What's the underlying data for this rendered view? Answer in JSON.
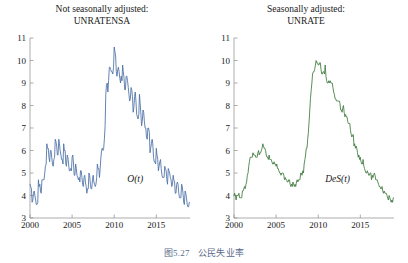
{
  "caption": {
    "number": "图5.27",
    "text": "公民失业率"
  },
  "panels": [
    {
      "title_line1": "Not seasonally adjusted:",
      "title_line2": "UNRATENSA",
      "curve_label": "O(t)",
      "color": "#4a6fa5"
    },
    {
      "title_line1": "Seasonally adjusted:",
      "title_line2": "UNRATE",
      "curve_label": "DeS(t)",
      "color": "#3e7a3e"
    }
  ],
  "chart_data": [
    {
      "type": "line",
      "title": "Not seasonally adjusted: UNRATENSA",
      "series_label": "O(t)",
      "color": "#4a6fa5",
      "xlabel": "",
      "ylabel": "",
      "xlim": [
        2000,
        2019
      ],
      "ylim": [
        3,
        11
      ],
      "xticks": [
        2000,
        2005,
        2010,
        2015
      ],
      "yticks": [
        3,
        4,
        5,
        6,
        7,
        8,
        9,
        10,
        11
      ],
      "grid": false,
      "legend": "none",
      "x": [
        2000.0,
        2000.08,
        2000.17,
        2000.25,
        2000.33,
        2000.42,
        2000.5,
        2000.58,
        2000.67,
        2000.75,
        2000.83,
        2000.92,
        2001.0,
        2001.08,
        2001.17,
        2001.25,
        2001.33,
        2001.42,
        2001.5,
        2001.58,
        2001.67,
        2001.75,
        2001.83,
        2001.92,
        2002.0,
        2002.08,
        2002.17,
        2002.25,
        2002.33,
        2002.42,
        2002.5,
        2002.58,
        2002.67,
        2002.75,
        2002.83,
        2002.92,
        2003.0,
        2003.08,
        2003.17,
        2003.25,
        2003.33,
        2003.42,
        2003.5,
        2003.58,
        2003.67,
        2003.75,
        2003.83,
        2003.92,
        2004.0,
        2004.08,
        2004.17,
        2004.25,
        2004.33,
        2004.42,
        2004.5,
        2004.58,
        2004.67,
        2004.75,
        2004.83,
        2004.92,
        2005.0,
        2005.08,
        2005.17,
        2005.25,
        2005.33,
        2005.42,
        2005.5,
        2005.58,
        2005.67,
        2005.75,
        2005.83,
        2005.92,
        2006.0,
        2006.08,
        2006.17,
        2006.25,
        2006.33,
        2006.42,
        2006.5,
        2006.58,
        2006.67,
        2006.75,
        2006.83,
        2006.92,
        2007.0,
        2007.08,
        2007.17,
        2007.25,
        2007.33,
        2007.42,
        2007.5,
        2007.58,
        2007.67,
        2007.75,
        2007.83,
        2007.92,
        2008.0,
        2008.08,
        2008.17,
        2008.25,
        2008.33,
        2008.42,
        2008.5,
        2008.58,
        2008.67,
        2008.75,
        2008.83,
        2008.92,
        2009.0,
        2009.08,
        2009.17,
        2009.25,
        2009.33,
        2009.42,
        2009.5,
        2009.58,
        2009.67,
        2009.75,
        2009.83,
        2009.92,
        2010.0,
        2010.08,
        2010.17,
        2010.25,
        2010.33,
        2010.42,
        2010.5,
        2010.58,
        2010.67,
        2010.75,
        2010.83,
        2010.92,
        2011.0,
        2011.08,
        2011.17,
        2011.25,
        2011.33,
        2011.42,
        2011.5,
        2011.58,
        2011.67,
        2011.75,
        2011.83,
        2011.92,
        2012.0,
        2012.08,
        2012.17,
        2012.25,
        2012.33,
        2012.42,
        2012.5,
        2012.58,
        2012.67,
        2012.75,
        2012.83,
        2012.92,
        2013.0,
        2013.08,
        2013.17,
        2013.25,
        2013.33,
        2013.42,
        2013.5,
        2013.58,
        2013.67,
        2013.75,
        2013.83,
        2013.92,
        2014.0,
        2014.08,
        2014.17,
        2014.25,
        2014.33,
        2014.42,
        2014.5,
        2014.58,
        2014.67,
        2014.75,
        2014.83,
        2014.92,
        2015.0,
        2015.08,
        2015.17,
        2015.25,
        2015.33,
        2015.42,
        2015.5,
        2015.58,
        2015.67,
        2015.75,
        2015.83,
        2015.92,
        2016.0,
        2016.08,
        2016.17,
        2016.25,
        2016.33,
        2016.42,
        2016.5,
        2016.58,
        2016.67,
        2016.75,
        2016.83,
        2016.92,
        2017.0,
        2017.08,
        2017.17,
        2017.25,
        2017.33,
        2017.42,
        2017.5,
        2017.58,
        2017.67,
        2017.75,
        2017.83,
        2017.92,
        2018.0,
        2018.08,
        2018.17,
        2018.25,
        2018.33,
        2018.42,
        2018.5,
        2018.58,
        2018.67,
        2018.75,
        2018.83,
        2018.92
      ],
      "y": [
        4.5,
        4.4,
        4.3,
        3.7,
        3.8,
        4.1,
        4.2,
        4.0,
        3.8,
        3.6,
        3.6,
        3.7,
        4.7,
        4.4,
        4.5,
        4.2,
        4.1,
        4.7,
        4.7,
        4.7,
        4.7,
        5.0,
        5.3,
        5.4,
        6.3,
        6.1,
        6.1,
        5.7,
        5.5,
        6.0,
        6.0,
        5.7,
        5.4,
        5.3,
        5.6,
        5.7,
        6.5,
        6.4,
        6.2,
        5.8,
        5.8,
        6.5,
        6.3,
        6.0,
        5.8,
        5.6,
        5.6,
        5.4,
        6.3,
        6.0,
        6.0,
        5.4,
        5.3,
        5.8,
        5.7,
        5.4,
        5.1,
        5.1,
        5.2,
        5.1,
        5.7,
        5.8,
        5.4,
        4.9,
        4.9,
        5.4,
        5.2,
        4.9,
        4.8,
        4.7,
        4.8,
        4.6,
        5.1,
        5.1,
        4.8,
        4.5,
        4.4,
        4.8,
        4.9,
        4.6,
        4.4,
        4.1,
        4.3,
        4.3,
        5.0,
        4.9,
        4.5,
        4.3,
        4.3,
        4.7,
        4.9,
        4.6,
        4.5,
        4.4,
        4.5,
        4.8,
        5.4,
        5.2,
        5.2,
        4.8,
        5.2,
        5.7,
        6.0,
        6.1,
        6.0,
        6.1,
        6.5,
        7.1,
        8.5,
        8.9,
        9.0,
        8.6,
        9.1,
        9.7,
        9.7,
        9.6,
        9.5,
        9.5,
        9.4,
        9.7,
        10.6,
        10.4,
        10.2,
        9.5,
        9.3,
        9.6,
        9.7,
        9.5,
        9.2,
        9.0,
        9.3,
        9.1,
        9.8,
        9.5,
        9.2,
        8.7,
        8.7,
        9.3,
        9.3,
        9.1,
        8.8,
        8.5,
        8.2,
        8.3,
        8.8,
        8.7,
        8.4,
        7.7,
        7.9,
        8.4,
        8.6,
        8.2,
        7.6,
        7.5,
        7.4,
        7.6,
        8.5,
        8.1,
        7.6,
        7.1,
        7.3,
        7.8,
        7.7,
        7.3,
        7.0,
        7.0,
        6.6,
        6.5,
        7.0,
        7.0,
        6.8,
        5.9,
        6.1,
        6.3,
        6.5,
        6.3,
        5.7,
        5.5,
        5.5,
        5.4,
        6.1,
        5.8,
        5.6,
        5.1,
        5.3,
        5.5,
        5.6,
        5.2,
        4.9,
        4.8,
        4.8,
        4.8,
        5.3,
        5.2,
        5.1,
        4.7,
        4.5,
        5.2,
        5.1,
        5.0,
        4.8,
        4.7,
        4.4,
        4.5,
        4.9,
        4.7,
        4.6,
        4.1,
        4.1,
        4.5,
        4.6,
        4.5,
        4.1,
        3.9,
        3.9,
        3.9,
        4.5,
        4.4,
        4.1,
        3.7,
        3.6,
        4.2,
        4.1,
        3.9,
        3.6,
        3.5,
        3.5,
        3.7
      ],
      "annotations": [
        {
          "text": "O(t)",
          "x": 2012.5,
          "y": 4.6,
          "style": "italic"
        }
      ]
    },
    {
      "type": "line",
      "title": "Seasonally adjusted: UNRATE",
      "series_label": "DeS(t)",
      "color": "#3e7a3e",
      "xlabel": "",
      "ylabel": "",
      "xlim": [
        2000,
        2019
      ],
      "ylim": [
        3,
        11
      ],
      "xticks": [
        2000,
        2005,
        2010,
        2015
      ],
      "yticks": [
        3,
        4,
        5,
        6,
        7,
        8,
        9,
        10,
        11
      ],
      "grid": false,
      "legend": "none",
      "x": [
        2000.0,
        2000.08,
        2000.17,
        2000.25,
        2000.33,
        2000.42,
        2000.5,
        2000.58,
        2000.67,
        2000.75,
        2000.83,
        2000.92,
        2001.0,
        2001.08,
        2001.17,
        2001.25,
        2001.33,
        2001.42,
        2001.5,
        2001.58,
        2001.67,
        2001.75,
        2001.83,
        2001.92,
        2002.0,
        2002.08,
        2002.17,
        2002.25,
        2002.33,
        2002.42,
        2002.5,
        2002.58,
        2002.67,
        2002.75,
        2002.83,
        2002.92,
        2003.0,
        2003.08,
        2003.17,
        2003.25,
        2003.33,
        2003.42,
        2003.5,
        2003.58,
        2003.67,
        2003.75,
        2003.83,
        2003.92,
        2004.0,
        2004.08,
        2004.17,
        2004.25,
        2004.33,
        2004.42,
        2004.5,
        2004.58,
        2004.67,
        2004.75,
        2004.83,
        2004.92,
        2005.0,
        2005.08,
        2005.17,
        2005.25,
        2005.33,
        2005.42,
        2005.5,
        2005.58,
        2005.67,
        2005.75,
        2005.83,
        2005.92,
        2006.0,
        2006.08,
        2006.17,
        2006.25,
        2006.33,
        2006.42,
        2006.5,
        2006.58,
        2006.67,
        2006.75,
        2006.83,
        2006.92,
        2007.0,
        2007.08,
        2007.17,
        2007.25,
        2007.33,
        2007.42,
        2007.5,
        2007.58,
        2007.67,
        2007.75,
        2007.83,
        2007.92,
        2008.0,
        2008.08,
        2008.17,
        2008.25,
        2008.33,
        2008.42,
        2008.5,
        2008.58,
        2008.67,
        2008.75,
        2008.83,
        2008.92,
        2009.0,
        2009.08,
        2009.17,
        2009.25,
        2009.33,
        2009.42,
        2009.5,
        2009.58,
        2009.67,
        2009.75,
        2009.83,
        2009.92,
        2010.0,
        2010.08,
        2010.17,
        2010.25,
        2010.33,
        2010.42,
        2010.5,
        2010.58,
        2010.67,
        2010.75,
        2010.83,
        2010.92,
        2011.0,
        2011.08,
        2011.17,
        2011.25,
        2011.33,
        2011.42,
        2011.5,
        2011.58,
        2011.67,
        2011.75,
        2011.83,
        2011.92,
        2012.0,
        2012.08,
        2012.17,
        2012.25,
        2012.33,
        2012.42,
        2012.5,
        2012.58,
        2012.67,
        2012.75,
        2012.83,
        2012.92,
        2013.0,
        2013.08,
        2013.17,
        2013.25,
        2013.33,
        2013.42,
        2013.5,
        2013.58,
        2013.67,
        2013.75,
        2013.83,
        2013.92,
        2014.0,
        2014.08,
        2014.17,
        2014.25,
        2014.33,
        2014.42,
        2014.5,
        2014.58,
        2014.67,
        2014.75,
        2014.83,
        2014.92,
        2015.0,
        2015.08,
        2015.17,
        2015.25,
        2015.33,
        2015.42,
        2015.5,
        2015.58,
        2015.67,
        2015.75,
        2015.83,
        2015.92,
        2016.0,
        2016.08,
        2016.17,
        2016.25,
        2016.33,
        2016.42,
        2016.5,
        2016.58,
        2016.67,
        2016.75,
        2016.83,
        2016.92,
        2017.0,
        2017.08,
        2017.17,
        2017.25,
        2017.33,
        2017.42,
        2017.5,
        2017.58,
        2017.67,
        2017.75,
        2017.83,
        2017.92,
        2018.0,
        2018.08,
        2018.17,
        2018.25,
        2018.33,
        2018.42,
        2018.5,
        2018.58,
        2018.67,
        2018.75,
        2018.83,
        2018.92
      ],
      "y": [
        4.0,
        4.1,
        4.0,
        3.8,
        4.0,
        4.0,
        4.0,
        4.1,
        3.9,
        3.9,
        3.9,
        3.9,
        4.2,
        4.2,
        4.3,
        4.4,
        4.3,
        4.5,
        4.6,
        4.9,
        5.0,
        5.3,
        5.5,
        5.7,
        5.7,
        5.7,
        5.7,
        5.9,
        5.8,
        5.8,
        5.8,
        5.7,
        5.7,
        5.7,
        5.9,
        6.0,
        5.8,
        5.9,
        5.9,
        6.0,
        6.1,
        6.3,
        6.2,
        6.1,
        6.1,
        6.0,
        5.8,
        5.7,
        5.7,
        5.6,
        5.8,
        5.6,
        5.6,
        5.6,
        5.5,
        5.4,
        5.4,
        5.5,
        5.4,
        5.4,
        5.3,
        5.4,
        5.2,
        5.2,
        5.1,
        5.0,
        5.0,
        4.9,
        5.0,
        5.0,
        5.0,
        4.9,
        4.7,
        4.8,
        4.7,
        4.7,
        4.6,
        4.6,
        4.7,
        4.7,
        4.5,
        4.4,
        4.5,
        4.4,
        4.6,
        4.5,
        4.4,
        4.5,
        4.4,
        4.6,
        4.7,
        4.6,
        4.7,
        4.7,
        4.7,
        5.0,
        5.0,
        4.9,
        5.1,
        5.0,
        5.4,
        5.6,
        5.8,
        6.1,
        6.1,
        6.5,
        6.8,
        7.3,
        7.8,
        8.3,
        8.7,
        9.0,
        9.4,
        9.5,
        9.5,
        9.6,
        9.8,
        10.0,
        9.9,
        9.9,
        9.8,
        9.8,
        9.9,
        9.9,
        9.6,
        9.4,
        9.4,
        9.5,
        9.5,
        9.4,
        9.8,
        9.3,
        9.1,
        9.0,
        9.0,
        9.1,
        9.0,
        9.1,
        9.0,
        9.0,
        9.0,
        8.8,
        8.6,
        8.5,
        8.3,
        8.3,
        8.2,
        8.2,
        8.2,
        8.2,
        8.2,
        8.1,
        7.8,
        7.8,
        7.7,
        7.9,
        8.0,
        7.7,
        7.5,
        7.6,
        7.5,
        7.5,
        7.3,
        7.2,
        7.2,
        7.2,
        6.9,
        6.7,
        6.6,
        6.7,
        6.7,
        6.2,
        6.3,
        6.1,
        6.2,
        6.1,
        5.9,
        5.7,
        5.8,
        5.6,
        5.7,
        5.5,
        5.4,
        5.4,
        5.6,
        5.3,
        5.2,
        5.1,
        5.0,
        5.0,
        5.1,
        5.0,
        4.9,
        4.9,
        5.0,
        5.0,
        4.7,
        4.9,
        4.8,
        4.9,
        5.0,
        4.9,
        4.7,
        4.7,
        4.7,
        4.6,
        4.5,
        4.4,
        4.4,
        4.3,
        4.3,
        4.4,
        4.2,
        4.1,
        4.2,
        4.1,
        4.1,
        4.1,
        4.0,
        3.9,
        3.8,
        4.0,
        3.9,
        3.8,
        3.7,
        3.8,
        3.7,
        3.9
      ],
      "annotations": [
        {
          "text": "DeS(t)",
          "x": 2012.3,
          "y": 4.6,
          "style": "italic"
        }
      ]
    }
  ]
}
